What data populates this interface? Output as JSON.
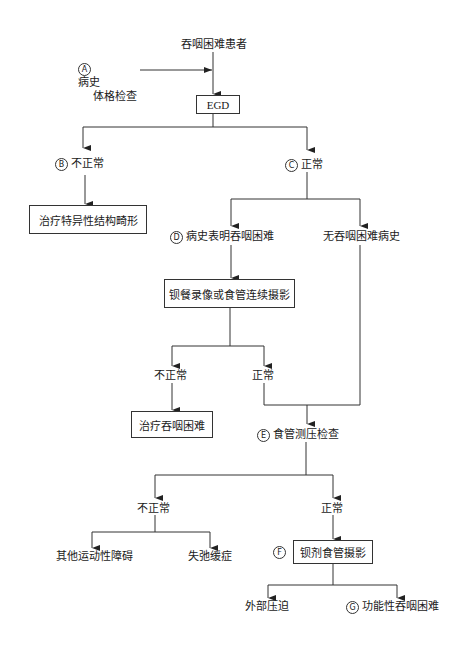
{
  "diagram": {
    "type": "flowchart",
    "nodes": {
      "start": {
        "text": "吞咽困难患者"
      },
      "a": {
        "marker": "A",
        "line1": "病史",
        "line2": "体格检查"
      },
      "egd": {
        "text": "EGD"
      },
      "b": {
        "marker": "B",
        "text": "不正常"
      },
      "b_treat": {
        "text": "治疗特异性结构畸形"
      },
      "c": {
        "marker": "C",
        "text": "正常"
      },
      "d": {
        "marker": "D",
        "text": "病史表明吞咽困难"
      },
      "no_hist": {
        "text": "无吞咽困难病史"
      },
      "barium_video": {
        "text": "钡餐录像或食管连续摄影"
      },
      "bv_abnormal": {
        "text": "不正常"
      },
      "bv_normal": {
        "text": "正常"
      },
      "treat_dysphagia": {
        "text": "治疗吞咽困难"
      },
      "e": {
        "marker": "E",
        "text": "食管测压检查"
      },
      "e_abnormal": {
        "text": "不正常"
      },
      "e_normal": {
        "text": "正常"
      },
      "other_motility": {
        "text": "其他运动性障碍"
      },
      "achalasia": {
        "text": "失弛缓症"
      },
      "f": {
        "marker": "F",
        "text": "钡剂食管摄影"
      },
      "external": {
        "text": "外部压迫"
      },
      "g": {
        "marker": "G",
        "text": "功能性吞咽困难"
      }
    }
  }
}
